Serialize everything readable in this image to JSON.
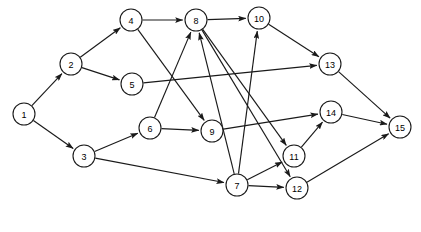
{
  "diagram": {
    "type": "directed-graph",
    "title": "",
    "background_color": "#ffffff",
    "node_fill_color": "#ffffff",
    "node_stroke_color": "#1a1a1a",
    "edge_color": "#1a1a1a",
    "node_radius": 11,
    "width": 421,
    "height": 232,
    "nodes": [
      {
        "id": "1",
        "label": "1",
        "x": 24,
        "y": 114
      },
      {
        "id": "2",
        "label": "2",
        "x": 71,
        "y": 64
      },
      {
        "id": "3",
        "label": "3",
        "x": 84,
        "y": 156
      },
      {
        "id": "4",
        "label": "4",
        "x": 131,
        "y": 20
      },
      {
        "id": "5",
        "label": "5",
        "x": 132,
        "y": 84
      },
      {
        "id": "6",
        "label": "6",
        "x": 150,
        "y": 128
      },
      {
        "id": "7",
        "label": "7",
        "x": 237,
        "y": 185
      },
      {
        "id": "8",
        "label": "8",
        "x": 196,
        "y": 20
      },
      {
        "id": "9",
        "label": "9",
        "x": 212,
        "y": 131
      },
      {
        "id": "10",
        "label": "10",
        "x": 259,
        "y": 18
      },
      {
        "id": "11",
        "label": "11",
        "x": 294,
        "y": 156
      },
      {
        "id": "12",
        "label": "12",
        "x": 297,
        "y": 188
      },
      {
        "id": "13",
        "label": "13",
        "x": 330,
        "y": 64
      },
      {
        "id": "14",
        "label": "14",
        "x": 331,
        "y": 112
      },
      {
        "id": "15",
        "label": "15",
        "x": 400,
        "y": 127
      }
    ],
    "edges": [
      {
        "from": "1",
        "to": "2"
      },
      {
        "from": "1",
        "to": "3"
      },
      {
        "from": "2",
        "to": "4"
      },
      {
        "from": "2",
        "to": "5"
      },
      {
        "from": "3",
        "to": "6"
      },
      {
        "from": "3",
        "to": "7"
      },
      {
        "from": "4",
        "to": "8"
      },
      {
        "from": "4",
        "to": "9"
      },
      {
        "from": "5",
        "to": "13"
      },
      {
        "from": "6",
        "to": "8"
      },
      {
        "from": "6",
        "to": "9"
      },
      {
        "from": "7",
        "to": "8"
      },
      {
        "from": "7",
        "to": "10"
      },
      {
        "from": "7",
        "to": "11"
      },
      {
        "from": "7",
        "to": "12"
      },
      {
        "from": "8",
        "to": "10"
      },
      {
        "from": "8",
        "to": "11"
      },
      {
        "from": "8",
        "to": "12"
      },
      {
        "from": "9",
        "to": "14"
      },
      {
        "from": "10",
        "to": "13"
      },
      {
        "from": "11",
        "to": "14"
      },
      {
        "from": "12",
        "to": "15"
      },
      {
        "from": "13",
        "to": "15"
      },
      {
        "from": "14",
        "to": "15"
      }
    ]
  }
}
